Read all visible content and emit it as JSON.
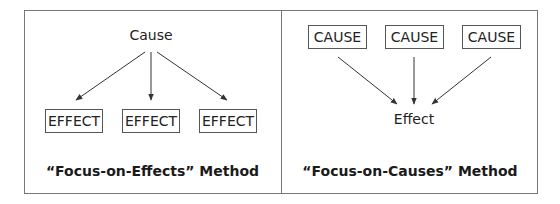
{
  "left_panel": {
    "source": "Cause",
    "targets": [
      "EFFECT",
      "EFFECT",
      "EFFECT"
    ],
    "caption": "“Focus-on-Effects” Method"
  },
  "right_panel": {
    "sources": [
      "CAUSE",
      "CAUSE",
      "CAUSE"
    ],
    "target": "Effect",
    "caption": "“Focus-on-Causes” Method"
  },
  "colors": {
    "border": "#777777",
    "arrow": "#333333",
    "text": "#222222"
  }
}
